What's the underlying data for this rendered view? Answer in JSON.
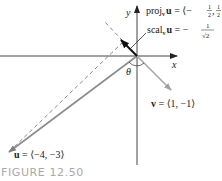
{
  "figure": {
    "caption": "FIGURE 12.50",
    "axes": {
      "x_label": "x",
      "y_label": "y"
    },
    "angle_label": "θ",
    "vectors": {
      "u": {
        "label_bold": "u",
        "label_rest": " = ⟨−4, −3⟩",
        "components": [
          -4,
          -3
        ]
      },
      "v": {
        "label_bold": "v",
        "label_rest": " = ⟨1, −1⟩",
        "components": [
          1,
          -1
        ]
      },
      "proj": {
        "prefix": "proj",
        "subscript": "v",
        "bold": "u",
        "eq": " = ⟨−",
        "frac1_num": "1",
        "frac1_den": "2",
        "sep": ", ",
        "frac2_num": "1",
        "frac2_den": "2",
        "close": "⟩",
        "components": [
          -0.5,
          0.5
        ]
      },
      "scal": {
        "prefix": "scal",
        "subscript": "v",
        "bold": "u",
        "eq": " = −",
        "frac_num": "1",
        "frac_den": "√2",
        "value": -0.7071
      }
    },
    "colors": {
      "axis": "#333333",
      "u_vector": "#8c8c8c",
      "v_vector": "#a6a6a6",
      "projection": "#111111",
      "dashed": "#7a7a7a",
      "caption": "#a9a9a9"
    }
  }
}
